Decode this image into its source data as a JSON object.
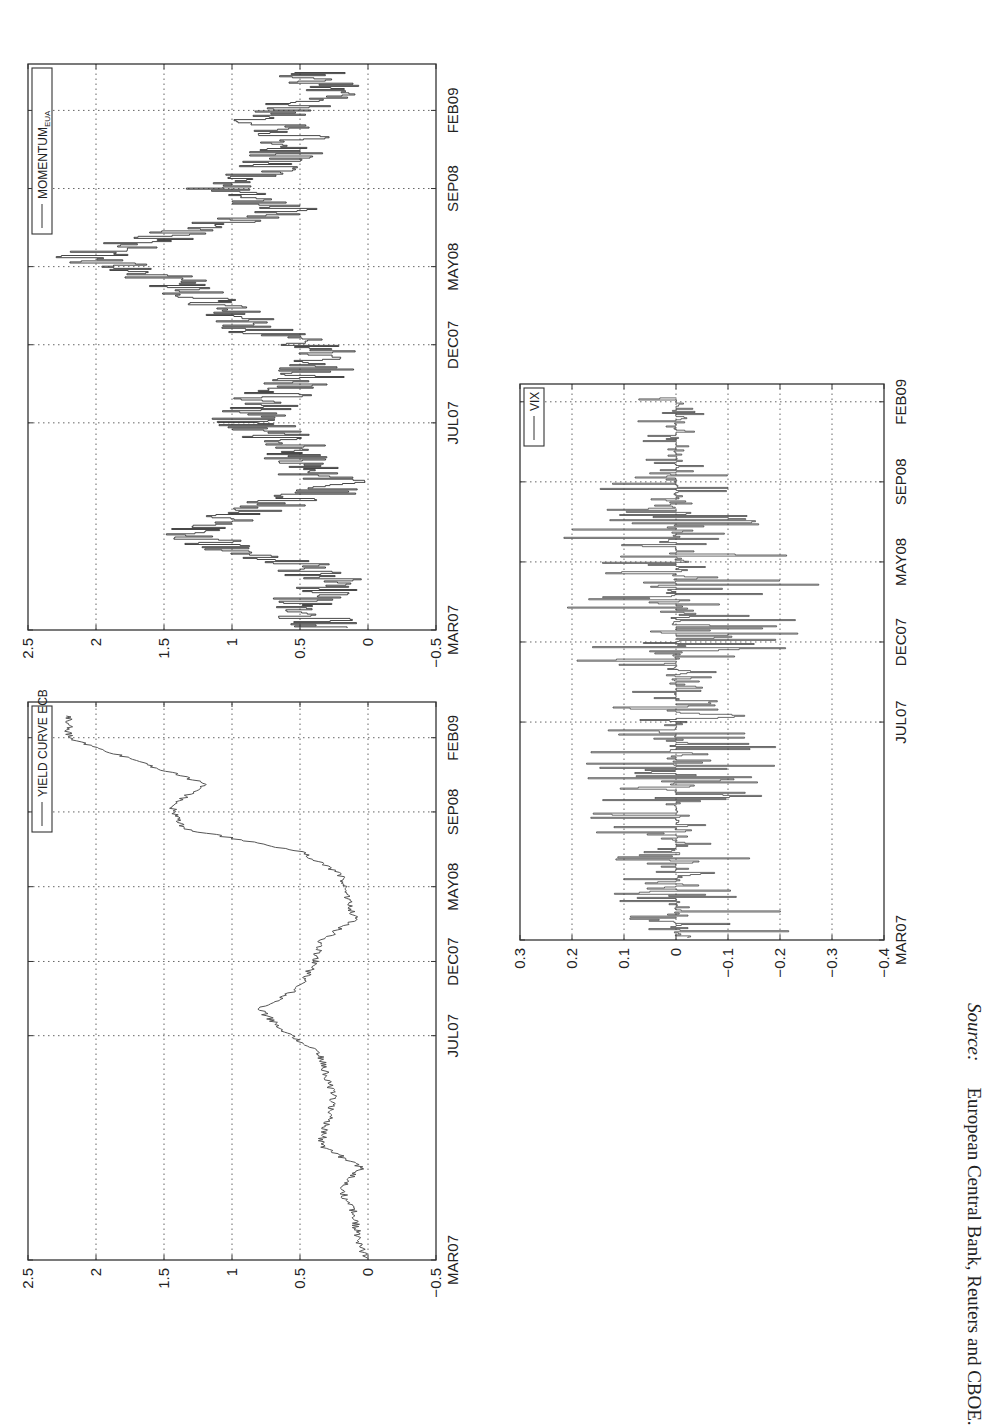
{
  "page": {
    "orientation": "rotated-90-ccw"
  },
  "chart_data": [
    {
      "id": "momentum",
      "type": "line",
      "title": "",
      "legend": [
        "MOMENTUM_EUA"
      ],
      "legend_label_main": "MOMENTUM",
      "legend_label_sub": "EUA",
      "xlabel": "",
      "ylabel": "",
      "x_tick_labels": [
        "MAR07",
        "JUL07",
        "DEC07",
        "MAY08",
        "SEP08",
        "FEB09"
      ],
      "y_tick_labels": [
        "-0.5",
        "0",
        "0.5",
        "1",
        "1.5",
        "2",
        "2.5"
      ],
      "ylim": [
        -0.5,
        2.5
      ],
      "grid": true,
      "line_color": "#333333",
      "series": [
        {
          "name": "MOMENTUM_EUA",
          "x": [
            "MAR07",
            "APR07",
            "MAY07",
            "JUN07",
            "JUL07",
            "AUG07",
            "SEP07",
            "OCT07",
            "NOV07",
            "DEC07",
            "JAN08",
            "FEB08",
            "MAR08",
            "APR08",
            "MAY08",
            "JUN08",
            "JUL08",
            "AUG08",
            "SEP08",
            "OCT08",
            "NOV08",
            "DEC08",
            "JAN09",
            "FEB09",
            "MAR09"
          ],
          "values": [
            0.3,
            0.5,
            0.2,
            0.7,
            1.35,
            0.9,
            0.2,
            0.5,
            0.6,
            0.9,
            0.7,
            0.4,
            0.3,
            0.9,
            1.1,
            1.45,
            2.1,
            1.4,
            0.6,
            1.1,
            0.7,
            0.5,
            0.75,
            0.3,
            0.4
          ]
        }
      ]
    },
    {
      "id": "yield_curve",
      "type": "line",
      "title": "",
      "legend": [
        "YIELD CURVE ECB"
      ],
      "xlabel": "",
      "ylabel": "",
      "x_tick_labels": [
        "MAR07",
        "JUL07",
        "DEC07",
        "MAY08",
        "SEP08",
        "FEB09"
      ],
      "y_tick_labels": [
        "-0.5",
        "0",
        "0.5",
        "1",
        "1.5",
        "2",
        "2.5"
      ],
      "ylim": [
        -0.5,
        2.5
      ],
      "grid": true,
      "line_color": "#555555",
      "series": [
        {
          "name": "YIELD CURVE ECB",
          "x": [
            "MAR07",
            "APR07",
            "MAY07",
            "JUN07",
            "JUL07",
            "AUG07",
            "SEP07",
            "OCT07",
            "NOV07",
            "DEC07",
            "JAN08",
            "FEB08",
            "MAR08",
            "APR08",
            "MAY08",
            "JUN08",
            "JUL08",
            "AUG08",
            "SEP08",
            "OCT08",
            "NOV08",
            "DEC08",
            "JAN09",
            "FEB09",
            "MAR09"
          ],
          "values": [
            0.02,
            0.08,
            0.1,
            0.2,
            0.05,
            0.35,
            0.3,
            0.25,
            0.3,
            0.35,
            0.6,
            0.8,
            0.5,
            0.4,
            0.35,
            0.1,
            0.15,
            0.2,
            0.5,
            1.35,
            1.45,
            1.2,
            1.7,
            2.2,
            2.2
          ]
        }
      ]
    },
    {
      "id": "vix",
      "type": "line",
      "title": "",
      "legend": [
        "VIX"
      ],
      "xlabel": "",
      "ylabel": "",
      "x_tick_labels": [
        "MAR07",
        "JUL07",
        "DEC07",
        "MAY08",
        "SEP08",
        "FEB09"
      ],
      "y_tick_labels": [
        "-0.4",
        "-0.3",
        "-0.2",
        "-0.1",
        "0",
        "0.1",
        "0.2",
        "0.3"
      ],
      "ylim": [
        -0.4,
        0.3
      ],
      "grid": true,
      "line_color": "#444444",
      "series": [
        {
          "name": "VIX",
          "description": "daily log changes oscillating around 0, typically within ±0.1, spikes to about +0.25 / -0.28 around SEP08-OCT08",
          "x": [
            "MAR07",
            "JUL07",
            "AUG07",
            "DEC07",
            "MAY08",
            "SEP08",
            "OCT08",
            "NOV08",
            "FEB09",
            "MAR09"
          ],
          "values_range_min": [
            -0.25,
            -0.15,
            -0.15,
            -0.22,
            -0.12,
            -0.25,
            -0.28,
            -0.15,
            -0.08,
            -0.05
          ],
          "values_range_max": [
            0.13,
            0.12,
            0.2,
            0.18,
            0.15,
            0.22,
            0.25,
            0.2,
            0.12,
            0.1
          ]
        }
      ]
    }
  ],
  "source": {
    "label": "Source:",
    "text": "European Central Bank, Reuters and CBOE."
  }
}
